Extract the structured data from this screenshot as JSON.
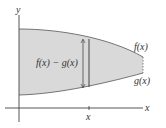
{
  "diagram": {
    "type": "area-between-curves",
    "axes": {
      "x_label": "x",
      "y_label": "y"
    },
    "curves": {
      "upper": {
        "label": "f(x)"
      },
      "lower": {
        "label": "g(x)"
      }
    },
    "strip": {
      "height_label": "f(x) − g(x)",
      "position_label": "x"
    },
    "colors": {
      "region_fill": "#d9d9d9",
      "curve_stroke": "#666666",
      "axis_stroke": "#444444",
      "background": "#ffffff"
    }
  }
}
